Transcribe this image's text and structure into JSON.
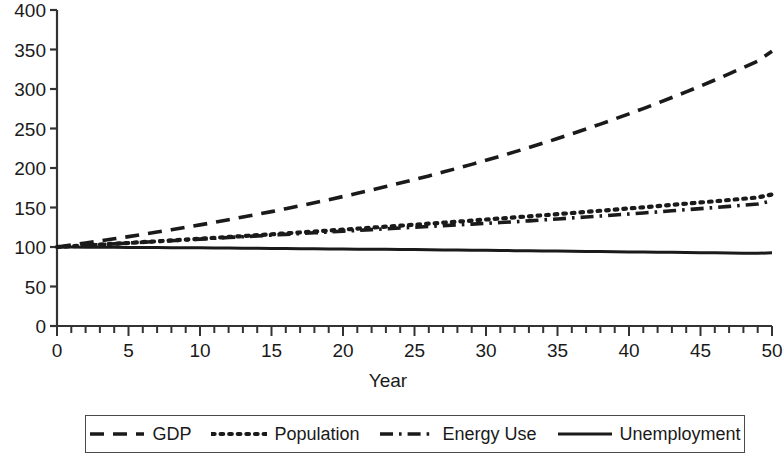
{
  "chart_data": {
    "type": "line",
    "title": "",
    "xlabel": "Year",
    "ylabel": "",
    "xlim": [
      0,
      50
    ],
    "ylim": [
      0,
      400
    ],
    "grid": false,
    "legend_position": "below",
    "x_ticks": [
      "0",
      "5",
      "10",
      "15",
      "20",
      "25",
      "30",
      "35",
      "40",
      "45",
      "50"
    ],
    "x_tick_values": [
      0,
      5,
      10,
      15,
      20,
      25,
      30,
      35,
      40,
      45,
      50
    ],
    "x_minor_tick_step": 1,
    "y_ticks": [
      "0",
      "50",
      "100",
      "150",
      "200",
      "250",
      "300",
      "350",
      "400"
    ],
    "y_tick_values": [
      0,
      50,
      100,
      150,
      200,
      250,
      300,
      350,
      400
    ],
    "x": [
      0,
      1,
      2,
      3,
      4,
      5,
      6,
      7,
      8,
      9,
      10,
      11,
      12,
      13,
      14,
      15,
      16,
      17,
      18,
      19,
      20,
      21,
      22,
      23,
      24,
      25,
      26,
      27,
      28,
      29,
      30,
      31,
      32,
      33,
      34,
      35,
      36,
      37,
      38,
      39,
      40,
      41,
      42,
      43,
      44,
      45,
      46,
      47,
      48,
      49,
      50
    ],
    "series": [
      {
        "name": "GDP",
        "style": "dashed",
        "color": "#1a1a1a",
        "values": [
          100,
          102.5,
          105.1,
          107.7,
          110.4,
          113.1,
          116,
          118.9,
          121.8,
          124.9,
          128,
          131.2,
          134.5,
          137.9,
          141.3,
          144.8,
          148.5,
          152.2,
          156,
          159.9,
          163.9,
          168,
          172.2,
          176.5,
          180.9,
          185.4,
          190,
          194.8,
          199.7,
          204.6,
          209.8,
          215,
          220.4,
          225.9,
          231.5,
          237.3,
          243.3,
          249.3,
          255.6,
          262,
          268.5,
          275.2,
          282.1,
          289.2,
          296.4,
          303.8,
          311.4,
          319.2,
          327.2,
          335.4,
          347.8
        ]
      },
      {
        "name": "Population",
        "style": "dotted",
        "color": "#1a1a1a",
        "values": [
          100,
          101,
          102,
          103,
          104.1,
          105.1,
          106.2,
          107.2,
          108.3,
          109.4,
          110.5,
          111.6,
          112.7,
          113.8,
          115,
          116.1,
          117.3,
          118.4,
          119.6,
          120.8,
          122,
          123.2,
          124.5,
          125.7,
          127,
          128.2,
          129.5,
          130.8,
          132.1,
          133.4,
          134.8,
          136.1,
          137.5,
          138.8,
          140.2,
          141.6,
          143,
          144.4,
          145.9,
          147.3,
          148.8,
          150.3,
          151.8,
          153.3,
          154.8,
          156.4,
          157.9,
          159.5,
          161.1,
          162.7,
          166.5
        ]
      },
      {
        "name": "Energy Use",
        "style": "dashdot",
        "color": "#1a1a1a",
        "values": [
          100,
          101,
          102,
          103,
          104,
          105,
          106,
          107,
          108,
          109,
          110,
          111,
          112,
          113,
          114,
          115,
          116,
          117,
          118,
          119,
          120,
          121,
          122,
          123,
          124,
          125,
          126,
          127,
          128,
          129,
          130,
          131,
          132,
          133.1,
          134.3,
          135.5,
          136.8,
          138,
          139.2,
          140.5,
          141.8,
          143.1,
          144.4,
          145.8,
          147.2,
          148.6,
          150,
          151.4,
          152.9,
          154.4,
          158.5
        ]
      },
      {
        "name": "Unemployment",
        "style": "solid",
        "color": "#1a1a1a",
        "values": [
          100,
          99.9,
          99.8,
          99.7,
          99.6,
          99.5,
          99.4,
          99.3,
          99.1,
          99,
          98.9,
          98.8,
          98.6,
          98.5,
          98.4,
          98.2,
          98.1,
          97.9,
          97.8,
          97.6,
          97.5,
          97.3,
          97.2,
          97,
          96.8,
          96.7,
          96.5,
          96.3,
          96.1,
          96,
          95.8,
          95.6,
          95.4,
          95.2,
          95,
          94.8,
          94.6,
          94.4,
          94.2,
          94,
          93.8,
          93.6,
          93.4,
          93.2,
          93,
          92.8,
          92.6,
          92.4,
          92.2,
          92,
          92.8
        ]
      }
    ]
  },
  "axis": {
    "xlabel": "Year"
  },
  "legend": {
    "entries": [
      {
        "label": "GDP",
        "style": "dashed"
      },
      {
        "label": "Population",
        "style": "dotted"
      },
      {
        "label": "Energy Use",
        "style": "dashdot"
      },
      {
        "label": "Unemployment",
        "style": "solid"
      }
    ]
  },
  "colors": {
    "ink": "#1a1a1a",
    "axis": "#333333",
    "background": "#ffffff"
  }
}
